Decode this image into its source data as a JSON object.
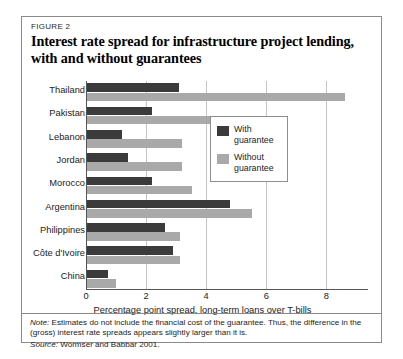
{
  "figure": {
    "number_label": "FIGURE 2",
    "title_line1": "Interest rate spread for infrastructure project lending,",
    "title_line2": "with and without guarantees",
    "note_label": "Note:",
    "note_text": " Estimates do not include the financial cost of the guarantee. Thus, the difference in the (gross) interest rate spreads appears slightly larger than it is.",
    "source_label": "Source:",
    "source_text": " Wormser and Babbar 2001."
  },
  "legend": {
    "items": [
      {
        "label_line1": "With",
        "label_line2": "guarantee",
        "color": "#3b3b3b"
      },
      {
        "label_line1": "Without",
        "label_line2": "guarantee",
        "color": "#a9a9a9"
      }
    ]
  },
  "chart_data": {
    "type": "bar",
    "orientation": "horizontal",
    "title": "Interest rate spread for infrastructure project lending, with and without guarantees",
    "xlabel": "Percentage point spread, long-term loans over T-bills",
    "ylabel": "",
    "xlim": [
      0,
      9.4
    ],
    "xticks": [
      0,
      2,
      4,
      6,
      8
    ],
    "xticklabels": [
      "0",
      "2",
      "4",
      "6",
      "8"
    ],
    "grid": "vertical",
    "legend_position": "inside-right-upper",
    "categories": [
      "Thailand",
      "Pakistan",
      "Lebanon",
      "Jordan",
      "Morocco",
      "Argentina",
      "Philippines",
      "Côte d'Ivoire",
      "China"
    ],
    "series": [
      {
        "name": "With guarantee",
        "color": "#3b3b3b",
        "values": [
          3.05,
          2.15,
          1.15,
          1.35,
          2.15,
          4.75,
          2.6,
          2.85,
          0.7
        ]
      },
      {
        "name": "Without guarantee",
        "color": "#a9a9a9",
        "values": [
          8.6,
          4.65,
          3.15,
          3.15,
          3.5,
          5.5,
          3.1,
          3.1,
          0.95
        ]
      }
    ]
  }
}
